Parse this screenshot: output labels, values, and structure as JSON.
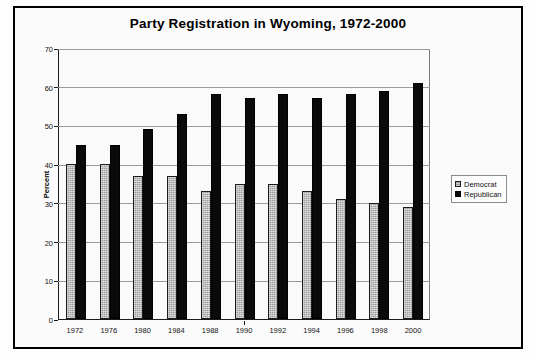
{
  "chart_data": {
    "type": "bar",
    "title": "Party Registration in Wyoming, 1972-2000",
    "xlabel": "",
    "ylabel": "Percent",
    "ylim": [
      0,
      70
    ],
    "yticks": [
      0,
      10,
      20,
      30,
      40,
      50,
      60,
      70
    ],
    "ytick_labels": [
      "0",
      "10",
      "20",
      "30",
      "40",
      "50",
      "60",
      "70"
    ],
    "grid": true,
    "legend_position": "right-middle",
    "categories": [
      "1972",
      "1976",
      "1980",
      "1984",
      "1988",
      "1990",
      "1992",
      "1994",
      "1996",
      "1998",
      "2000"
    ],
    "series": [
      {
        "name": "Democrat",
        "color": "#9c9c9c",
        "values": [
          40,
          40,
          37,
          37,
          33,
          35,
          35,
          33,
          31,
          30,
          29
        ]
      },
      {
        "name": "Republican",
        "color": "#0a0a0a",
        "values": [
          45,
          45,
          49,
          53,
          58,
          57,
          58,
          57,
          58,
          59,
          61
        ]
      }
    ]
  },
  "legend": {
    "entries": [
      {
        "label": "Democrat"
      },
      {
        "label": "Republican"
      }
    ]
  }
}
